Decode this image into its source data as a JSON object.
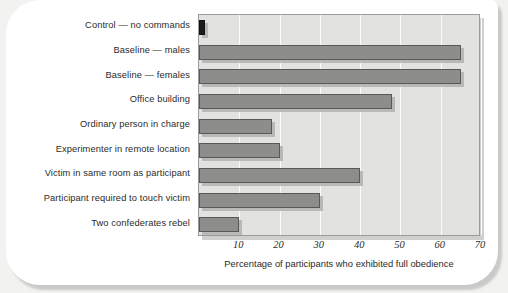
{
  "chart_data": {
    "type": "bar",
    "orientation": "horizontal",
    "title": "",
    "xlabel": "Percentage of participants who exhibited full obedience",
    "ylabel": "",
    "xlim": [
      0,
      70
    ],
    "xticks": [
      10,
      20,
      30,
      40,
      50,
      60,
      70
    ],
    "xtick_labels": [
      "10",
      "20",
      "30",
      "40",
      "50",
      "60",
      "70"
    ],
    "grid": true,
    "legend": false,
    "categories": [
      "Control — no commands",
      "Baseline — males",
      "Baseline — females",
      "Office building",
      "Ordinary person in charge",
      "Experimenter in remote location",
      "Victim in same room as participant",
      "Participant required to touch victim",
      "Two confederates rebel"
    ],
    "values": [
      1,
      65,
      65,
      48,
      18,
      20,
      40,
      30,
      10
    ],
    "bar_colors": [
      "#1c1c1a",
      "#8d8d8b",
      "#8d8d8b",
      "#8d8d8b",
      "#8d8d8b",
      "#8d8d8b",
      "#8d8d8b",
      "#8d8d8b",
      "#8d8d8b"
    ],
    "plot_background": "#e2e2e0",
    "gridline_color": "#fbfbfa",
    "bar_outline_color": "#585856"
  }
}
